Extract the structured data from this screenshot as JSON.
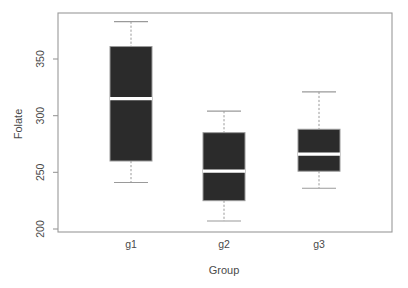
{
  "chart_data": {
    "type": "box",
    "title": "",
    "xlabel": "Group",
    "ylabel": "Folate",
    "categories": [
      "g1",
      "g2",
      "g3"
    ],
    "ylim": [
      195,
      390
    ],
    "yticks": [
      200,
      250,
      300,
      350
    ],
    "ytick_labels": [
      "200",
      "250",
      "300",
      "350"
    ],
    "grid": false,
    "legend": null,
    "box_fill_color": "#2b2b2b",
    "median_color": "#ffffff",
    "axis_color": "#9a9a9a",
    "boxes": [
      {
        "category": "g1",
        "whisker_low": 241,
        "q1": 260,
        "median": 315,
        "q3": 361,
        "whisker_high": 383
      },
      {
        "category": "g2",
        "whisker_low": 207,
        "q1": 225,
        "median": 251,
        "q3": 285,
        "whisker_high": 304
      },
      {
        "category": "g3",
        "whisker_low": 236,
        "q1": 251,
        "median": 266,
        "q3": 288,
        "whisker_high": 321
      }
    ]
  }
}
